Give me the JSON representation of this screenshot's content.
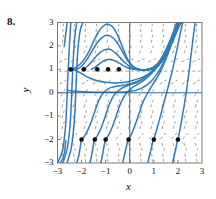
{
  "figure": {
    "exercise_number": "8.",
    "type": "slope-field-with-solution-curves",
    "curve_color": "#2f7cb8",
    "field_color": "#8a7a6e",
    "marker_color": "#111111",
    "axis_color": "#1d5a92",
    "frame_color": "#6d6d6d"
  },
  "axes": {
    "xlabel": "x",
    "ylabel": "y",
    "xlim": [
      -3,
      3
    ],
    "ylim": [
      -3,
      3
    ],
    "xticks": [
      -3,
      -2,
      -1,
      0,
      1,
      2,
      3
    ],
    "yticks": [
      -3,
      -2,
      -1,
      0,
      1,
      2,
      3
    ],
    "xticklabels": [
      "−3",
      "−2",
      "−1",
      "0",
      "1",
      "2",
      "3"
    ],
    "yticklabels": [
      "−3",
      "−2",
      "−1",
      "0",
      "1",
      "2",
      "3"
    ],
    "grid": false
  },
  "chart_data": {
    "type": "line",
    "title": "",
    "xlabel": "x",
    "ylabel": "y",
    "xlim": [
      -3,
      3
    ],
    "ylim": [
      -3,
      3
    ],
    "grid": false,
    "legend": "none",
    "equilibria": [
      {
        "y": 1,
        "kind": "semistable"
      },
      {
        "y": -2,
        "kind": "unstable"
      }
    ],
    "initial_condition_markers": {
      "row_upper_y": 1,
      "row_upper_x": [
        -2.45,
        -1.9,
        -1.35,
        -0.9,
        -0.45
      ],
      "row_lower_y": -2,
      "row_lower_x": [
        -2.0,
        -1.45,
        -1.0,
        -0.05,
        1.0,
        2.0
      ]
    },
    "series": [
      {
        "name": "curve-1",
        "points": [
          [
            -3.0,
            -3.0
          ],
          [
            -2.8,
            -2.5
          ],
          [
            -2.68,
            -1.6
          ],
          [
            -2.62,
            -0.6
          ],
          [
            -2.58,
            0.45
          ],
          [
            -2.54,
            1.3
          ],
          [
            -2.5,
            2.1
          ],
          [
            -2.45,
            3.0
          ]
        ]
      },
      {
        "name": "curve-2",
        "points": [
          [
            -2.78,
            -3.0
          ],
          [
            -2.6,
            -2.4
          ],
          [
            -2.48,
            -1.4
          ],
          [
            -2.42,
            -0.3
          ],
          [
            -2.38,
            0.7
          ],
          [
            -2.33,
            1.7
          ],
          [
            -2.27,
            2.5
          ],
          [
            -2.2,
            3.0
          ]
        ]
      },
      {
        "name": "curve-3",
        "points": [
          [
            -2.6,
            -3.0
          ],
          [
            -2.42,
            -2.3
          ],
          [
            -2.3,
            -1.2
          ],
          [
            -2.24,
            0.0
          ],
          [
            -2.2,
            1.05
          ],
          [
            -2.14,
            2.0
          ],
          [
            -2.05,
            2.7
          ],
          [
            -1.95,
            3.0
          ]
        ]
      },
      {
        "name": "curve-4",
        "points": [
          [
            -2.45,
            1.0
          ],
          [
            -2.2,
            1.1
          ],
          [
            -1.95,
            1.35
          ],
          [
            -1.7,
            1.75
          ],
          [
            -1.5,
            2.2
          ],
          [
            -1.3,
            2.6
          ],
          [
            -1.1,
            2.85
          ],
          [
            -0.9,
            2.93
          ],
          [
            -0.7,
            2.8
          ],
          [
            -0.5,
            2.45
          ],
          [
            -0.3,
            1.95
          ],
          [
            -0.1,
            1.45
          ],
          [
            0.1,
            1.15
          ],
          [
            0.35,
            1.0
          ],
          [
            0.6,
            0.95
          ],
          [
            0.9,
            1.0
          ],
          [
            1.2,
            1.2
          ],
          [
            1.5,
            1.65
          ],
          [
            1.8,
            2.3
          ],
          [
            2.05,
            2.9
          ],
          [
            2.2,
            3.0
          ]
        ]
      },
      {
        "name": "curve-5",
        "points": [
          [
            -2.3,
            1.0
          ],
          [
            -2.1,
            1.05
          ],
          [
            -1.9,
            1.25
          ],
          [
            -1.7,
            1.55
          ],
          [
            -1.5,
            1.9
          ],
          [
            -1.3,
            2.2
          ],
          [
            -1.1,
            2.4
          ],
          [
            -0.9,
            2.45
          ],
          [
            -0.7,
            2.35
          ],
          [
            -0.5,
            2.1
          ],
          [
            -0.3,
            1.75
          ],
          [
            -0.1,
            1.4
          ],
          [
            0.15,
            1.12
          ],
          [
            0.4,
            1.0
          ],
          [
            0.7,
            0.98
          ],
          [
            1.0,
            1.1
          ],
          [
            1.3,
            1.4
          ],
          [
            1.6,
            1.95
          ],
          [
            1.9,
            2.65
          ],
          [
            2.15,
            3.0
          ]
        ]
      },
      {
        "name": "curve-6",
        "points": [
          [
            -2.0,
            1.0
          ],
          [
            -1.8,
            1.1
          ],
          [
            -1.6,
            1.3
          ],
          [
            -1.4,
            1.55
          ],
          [
            -1.2,
            1.75
          ],
          [
            -1.0,
            1.85
          ],
          [
            -0.8,
            1.85
          ],
          [
            -0.6,
            1.7
          ],
          [
            -0.4,
            1.5
          ],
          [
            -0.2,
            1.28
          ],
          [
            0.05,
            1.1
          ],
          [
            0.3,
            1.0
          ],
          [
            0.6,
            0.98
          ],
          [
            0.95,
            1.05
          ],
          [
            1.25,
            1.3
          ],
          [
            1.55,
            1.8
          ],
          [
            1.85,
            2.5
          ],
          [
            2.1,
            3.0
          ]
        ]
      },
      {
        "name": "curve-7",
        "points": [
          [
            -1.6,
            1.0
          ],
          [
            -1.45,
            1.08
          ],
          [
            -1.3,
            1.2
          ],
          [
            -1.1,
            1.35
          ],
          [
            -0.9,
            1.42
          ],
          [
            -0.7,
            1.4
          ],
          [
            -0.5,
            1.3
          ],
          [
            -0.3,
            1.18
          ],
          [
            -0.1,
            1.08
          ],
          [
            0.15,
            1.0
          ],
          [
            0.45,
            0.97
          ],
          [
            0.8,
            1.0
          ],
          [
            1.1,
            1.18
          ],
          [
            1.4,
            1.6
          ],
          [
            1.7,
            2.2
          ],
          [
            1.95,
            2.8
          ],
          [
            2.08,
            3.0
          ]
        ]
      },
      {
        "name": "curve-8",
        "points": [
          [
            -2.45,
            1.0
          ],
          [
            -2.25,
            0.95
          ],
          [
            -2.05,
            0.85
          ],
          [
            -1.85,
            0.72
          ],
          [
            -1.6,
            0.6
          ],
          [
            -1.3,
            0.5
          ],
          [
            -1.0,
            0.45
          ],
          [
            -0.6,
            0.42
          ],
          [
            -0.2,
            0.45
          ],
          [
            0.2,
            0.55
          ],
          [
            0.6,
            0.7
          ],
          [
            1.0,
            0.95
          ],
          [
            1.35,
            1.35
          ],
          [
            1.7,
            2.0
          ],
          [
            1.95,
            2.6
          ],
          [
            2.12,
            3.0
          ]
        ]
      },
      {
        "name": "curve-9",
        "points": [
          [
            -2.55,
            0.1
          ],
          [
            -2.4,
            0.08
          ],
          [
            -2.1,
            0.05
          ],
          [
            -1.7,
            0.03
          ],
          [
            -1.2,
            0.02
          ],
          [
            -0.6,
            0.02
          ],
          [
            0.0,
            0.05
          ],
          [
            0.5,
            0.2
          ],
          [
            0.9,
            0.5
          ],
          [
            1.25,
            1.0
          ],
          [
            1.6,
            1.75
          ],
          [
            1.9,
            2.55
          ],
          [
            2.1,
            3.0
          ]
        ]
      },
      {
        "name": "curve-10",
        "points": [
          [
            -2.0,
            -2.0
          ],
          [
            -1.85,
            -1.8
          ],
          [
            -1.7,
            -1.5
          ],
          [
            -1.55,
            -1.1
          ],
          [
            -1.4,
            -0.65
          ],
          [
            -1.25,
            -0.25
          ],
          [
            -1.05,
            0.05
          ],
          [
            -0.8,
            0.22
          ],
          [
            -0.4,
            0.3
          ],
          [
            0.0,
            0.38
          ],
          [
            0.45,
            0.55
          ],
          [
            0.9,
            0.9
          ],
          [
            1.3,
            1.45
          ],
          [
            1.65,
            2.15
          ],
          [
            1.95,
            2.9
          ],
          [
            2.05,
            3.0
          ]
        ]
      },
      {
        "name": "curve-11",
        "points": [
          [
            -1.45,
            -2.0
          ],
          [
            -1.3,
            -1.75
          ],
          [
            -1.15,
            -1.4
          ],
          [
            -1.0,
            -0.95
          ],
          [
            -0.85,
            -0.5
          ],
          [
            -0.65,
            -0.1
          ],
          [
            -0.4,
            0.15
          ],
          [
            -0.1,
            0.3
          ],
          [
            0.3,
            0.45
          ],
          [
            0.7,
            0.7
          ],
          [
            1.1,
            1.1
          ],
          [
            1.45,
            1.7
          ],
          [
            1.8,
            2.45
          ],
          [
            2.0,
            3.0
          ]
        ]
      },
      {
        "name": "curve-12",
        "points": [
          [
            -1.0,
            -2.0
          ],
          [
            -0.85,
            -1.75
          ],
          [
            -0.7,
            -1.4
          ],
          [
            -0.55,
            -0.95
          ],
          [
            -0.4,
            -0.5
          ],
          [
            -0.2,
            -0.1
          ],
          [
            0.05,
            0.18
          ],
          [
            0.35,
            0.38
          ],
          [
            0.7,
            0.62
          ],
          [
            1.05,
            1.0
          ],
          [
            1.4,
            1.6
          ],
          [
            1.72,
            2.35
          ],
          [
            1.95,
            3.0
          ]
        ]
      },
      {
        "name": "curve-13",
        "points": [
          [
            -0.05,
            -2.0
          ],
          [
            0.1,
            -1.7
          ],
          [
            0.25,
            -1.3
          ],
          [
            0.4,
            -0.85
          ],
          [
            0.55,
            -0.4
          ],
          [
            0.75,
            0.0
          ],
          [
            0.95,
            0.35
          ],
          [
            1.2,
            0.75
          ],
          [
            1.45,
            1.3
          ],
          [
            1.7,
            2.0
          ],
          [
            1.9,
            2.7
          ],
          [
            2.0,
            3.0
          ]
        ]
      },
      {
        "name": "curve-14",
        "points": [
          [
            1.0,
            -2.0
          ],
          [
            1.1,
            -1.65
          ],
          [
            1.22,
            -1.2
          ],
          [
            1.35,
            -0.7
          ],
          [
            1.48,
            -0.2
          ],
          [
            1.62,
            0.35
          ],
          [
            1.78,
            1.0
          ],
          [
            1.95,
            1.8
          ],
          [
            2.1,
            2.55
          ],
          [
            2.2,
            3.0
          ]
        ]
      },
      {
        "name": "curve-15",
        "points": [
          [
            2.0,
            -2.0
          ],
          [
            2.08,
            -1.6
          ],
          [
            2.16,
            -1.15
          ],
          [
            2.25,
            -0.6
          ],
          [
            2.35,
            0.05
          ],
          [
            2.45,
            0.8
          ],
          [
            2.55,
            1.65
          ],
          [
            2.65,
            2.5
          ],
          [
            2.72,
            3.0
          ]
        ]
      },
      {
        "name": "curve-16",
        "points": [
          [
            -2.9,
            -3.0
          ],
          [
            -2.8,
            -2.85
          ],
          [
            -2.72,
            -2.6
          ],
          [
            -2.68,
            -2.3
          ],
          [
            -2.66,
            -2.05
          ]
        ]
      },
      {
        "name": "curve-17",
        "points": [
          [
            -2.2,
            -3.0
          ],
          [
            -2.12,
            -2.7
          ],
          [
            -2.06,
            -2.35
          ],
          [
            -2.02,
            -2.05
          ]
        ]
      },
      {
        "name": "curve-18",
        "points": [
          [
            -1.65,
            -3.0
          ],
          [
            -1.58,
            -2.65
          ],
          [
            -1.52,
            -2.3
          ],
          [
            -1.48,
            -2.02
          ]
        ]
      },
      {
        "name": "curve-19",
        "points": [
          [
            -1.2,
            -3.0
          ],
          [
            -1.13,
            -2.65
          ],
          [
            -1.07,
            -2.3
          ],
          [
            -1.02,
            -2.02
          ]
        ]
      },
      {
        "name": "curve-20",
        "points": [
          [
            -0.3,
            -3.0
          ],
          [
            -0.22,
            -2.65
          ],
          [
            -0.14,
            -2.3
          ],
          [
            -0.08,
            -2.02
          ]
        ]
      },
      {
        "name": "curve-21",
        "points": [
          [
            0.75,
            -3.0
          ],
          [
            0.82,
            -2.68
          ],
          [
            0.9,
            -2.35
          ],
          [
            0.97,
            -2.02
          ]
        ]
      },
      {
        "name": "curve-22",
        "points": [
          [
            1.78,
            -3.0
          ],
          [
            1.85,
            -2.68
          ],
          [
            1.92,
            -2.35
          ],
          [
            1.98,
            -2.02
          ]
        ]
      },
      {
        "name": "curve-23",
        "points": [
          [
            -2.72,
            2.0
          ],
          [
            -2.66,
            2.5
          ],
          [
            -2.6,
            3.0
          ]
        ]
      }
    ]
  }
}
